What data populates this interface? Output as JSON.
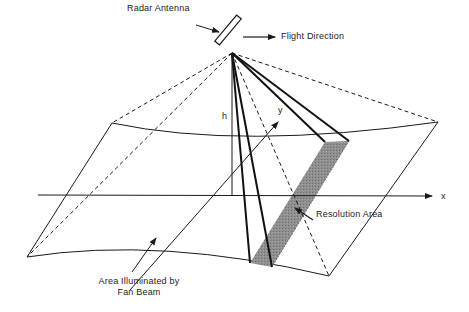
{
  "diagram": {
    "type": "SAR imaging geometry",
    "labels": {
      "radar_antenna": "Radar Antenna",
      "flight_direction": "Flight Direction",
      "height": "h",
      "y_axis": "y",
      "x_axis": "x",
      "resolution_area": "Resolution Area",
      "area_illuminated_line1": "Area Illuminated by",
      "area_illuminated_line2": "Fan Beam"
    },
    "colors": {
      "line": "#1a1a1a",
      "shading": "#8a8a8a",
      "background": "#ffffff"
    }
  }
}
